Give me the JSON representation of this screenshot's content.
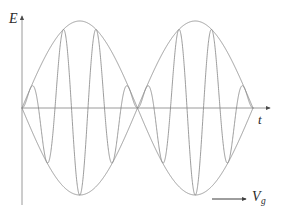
{
  "figure": {
    "background_color": "#ffffff",
    "line_color": "#8a8a8a",
    "axis_color": "#8a8a8a",
    "text_color": "#2b2b2b"
  },
  "labels": {
    "y_axis": "E",
    "x_axis": "t",
    "group_velocity": "V",
    "group_velocity_subscript": "g"
  },
  "chart_data": {
    "type": "line",
    "title": "",
    "xlabel": "t",
    "ylabel": "E",
    "grid": false,
    "legend": false,
    "annotations": [
      {
        "name": "group-velocity-arrow",
        "label": "Vg",
        "direction": "right"
      }
    ],
    "axes": {
      "origin_px": [
        22,
        108
      ],
      "x_axis_end_px": [
        272,
        108
      ],
      "y_axis_top_px": [
        22,
        14
      ],
      "y_axis_bottom_px": [
        22,
        205
      ],
      "x_arrow": true,
      "y_arrow": true
    },
    "geometry": {
      "x_start_px": 22,
      "x_end_px": 253,
      "baseline_y_px": 108,
      "amplitude_px": 87,
      "envelope_half_period_px": 115.5,
      "carrier_half_period_px": 16.5,
      "node_px": [
        140,
        108
      ]
    },
    "series": [
      {
        "name": "envelope-upper",
        "description": "Upper envelope, |sin| shaped, two lobes",
        "form": "A*|sin(pi*(x-x0)/L)|",
        "amplitude": 1.0,
        "lobes": 2
      },
      {
        "name": "envelope-lower",
        "description": "Lower envelope, mirror of upper",
        "form": "-A*|sin(pi*(x-x0)/L)|",
        "amplitude": -1.0,
        "lobes": 2
      },
      {
        "name": "carrier",
        "description": "High frequency carrier amplitude-modulated by the envelope",
        "form": "A*sin(pi*(x-x0)/L)*sin(7*pi*(x-x0)/L)",
        "carrier_half_cycles_per_lobe": 7
      }
    ]
  }
}
